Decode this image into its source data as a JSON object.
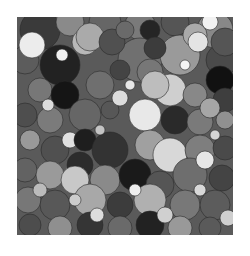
{
  "canvas": {
    "width": 250,
    "height": 256,
    "background": "#ffffff",
    "plot": {
      "x": 17,
      "y": 17,
      "width": 216,
      "height": 218,
      "fill": "#5a5a5a"
    }
  },
  "stroke": {
    "color": "#2a2a2a",
    "width": 0.6
  },
  "circles": [
    {
      "cx": 40,
      "cy": 30,
      "r": 20,
      "fill": "#3a3a3a"
    },
    {
      "cx": 70,
      "cy": 22,
      "r": 14,
      "fill": "#8a8a8a"
    },
    {
      "cx": 105,
      "cy": 22,
      "r": 16,
      "fill": "#666666"
    },
    {
      "cx": 140,
      "cy": 25,
      "r": 15,
      "fill": "#7a7a7a"
    },
    {
      "cx": 175,
      "cy": 22,
      "r": 14,
      "fill": "#555555"
    },
    {
      "cx": 215,
      "cy": 30,
      "r": 18,
      "fill": "#888888"
    },
    {
      "cx": 25,
      "cy": 60,
      "r": 14,
      "fill": "#5c5c5c"
    },
    {
      "cx": 60,
      "cy": 65,
      "r": 20,
      "fill": "#222222"
    },
    {
      "cx": 140,
      "cy": 60,
      "r": 22,
      "fill": "#707070"
    },
    {
      "cx": 180,
      "cy": 55,
      "r": 20,
      "fill": "#9a9a9a"
    },
    {
      "cx": 222,
      "cy": 60,
      "r": 16,
      "fill": "#4a4a4a"
    },
    {
      "cx": 85,
      "cy": 42,
      "r": 13,
      "fill": "#b8b8b8"
    },
    {
      "cx": 32,
      "cy": 45,
      "r": 13,
      "fill": "#ececec"
    },
    {
      "cx": 90,
      "cy": 37,
      "r": 14,
      "fill": "#aaaaaa"
    },
    {
      "cx": 112,
      "cy": 42,
      "r": 13,
      "fill": "#505050"
    },
    {
      "cx": 125,
      "cy": 30,
      "r": 9,
      "fill": "#6a6a6a"
    },
    {
      "cx": 150,
      "cy": 30,
      "r": 10,
      "fill": "#252525"
    },
    {
      "cx": 155,
      "cy": 48,
      "r": 11,
      "fill": "#3c3c3c"
    },
    {
      "cx": 150,
      "cy": 72,
      "r": 13,
      "fill": "#777777"
    },
    {
      "cx": 195,
      "cy": 35,
      "r": 12,
      "fill": "#aaaaaa"
    },
    {
      "cx": 210,
      "cy": 22,
      "r": 8,
      "fill": "#f2f2f2"
    },
    {
      "cx": 198,
      "cy": 42,
      "r": 10,
      "fill": "#e4e4e4"
    },
    {
      "cx": 225,
      "cy": 42,
      "r": 14,
      "fill": "#555555"
    },
    {
      "cx": 220,
      "cy": 80,
      "r": 14,
      "fill": "#111111"
    },
    {
      "cx": 40,
      "cy": 90,
      "r": 12,
      "fill": "#777777"
    },
    {
      "cx": 65,
      "cy": 95,
      "r": 14,
      "fill": "#151515"
    },
    {
      "cx": 100,
      "cy": 85,
      "r": 14,
      "fill": "#6f6f6f"
    },
    {
      "cx": 120,
      "cy": 70,
      "r": 10,
      "fill": "#444444"
    },
    {
      "cx": 170,
      "cy": 90,
      "r": 16,
      "fill": "#cfcfcf"
    },
    {
      "cx": 155,
      "cy": 85,
      "r": 14,
      "fill": "#bdbdbd"
    },
    {
      "cx": 195,
      "cy": 95,
      "r": 12,
      "fill": "#888888"
    },
    {
      "cx": 225,
      "cy": 100,
      "r": 12,
      "fill": "#3e3e3e"
    },
    {
      "cx": 25,
      "cy": 115,
      "r": 12,
      "fill": "#4e4e4e"
    },
    {
      "cx": 50,
      "cy": 120,
      "r": 13,
      "fill": "#7b7b7b"
    },
    {
      "cx": 85,
      "cy": 115,
      "r": 16,
      "fill": "#666666"
    },
    {
      "cx": 110,
      "cy": 110,
      "r": 9,
      "fill": "#575757"
    },
    {
      "cx": 120,
      "cy": 98,
      "r": 8,
      "fill": "#dcdcdc"
    },
    {
      "cx": 145,
      "cy": 115,
      "r": 16,
      "fill": "#e8e8e8"
    },
    {
      "cx": 175,
      "cy": 120,
      "r": 14,
      "fill": "#2a2a2a"
    },
    {
      "cx": 200,
      "cy": 122,
      "r": 13,
      "fill": "#7a7a7a"
    },
    {
      "cx": 225,
      "cy": 120,
      "r": 9,
      "fill": "#909090"
    },
    {
      "cx": 210,
      "cy": 108,
      "r": 10,
      "fill": "#a6a6a6"
    },
    {
      "cx": 30,
      "cy": 140,
      "r": 10,
      "fill": "#999999"
    },
    {
      "cx": 55,
      "cy": 150,
      "r": 14,
      "fill": "#505050"
    },
    {
      "cx": 70,
      "cy": 140,
      "r": 8,
      "fill": "#e0e0e0"
    },
    {
      "cx": 85,
      "cy": 140,
      "r": 11,
      "fill": "#1e1e1e"
    },
    {
      "cx": 110,
      "cy": 150,
      "r": 18,
      "fill": "#333333"
    },
    {
      "cx": 150,
      "cy": 145,
      "r": 15,
      "fill": "#a0a0a0"
    },
    {
      "cx": 170,
      "cy": 155,
      "r": 17,
      "fill": "#d8d8d8"
    },
    {
      "cx": 200,
      "cy": 150,
      "r": 15,
      "fill": "#7e7e7e"
    },
    {
      "cx": 225,
      "cy": 148,
      "r": 12,
      "fill": "#4a4a4a"
    },
    {
      "cx": 25,
      "cy": 170,
      "r": 12,
      "fill": "#626262"
    },
    {
      "cx": 50,
      "cy": 175,
      "r": 14,
      "fill": "#9a9a9a"
    },
    {
      "cx": 80,
      "cy": 165,
      "r": 13,
      "fill": "#2c2c2c"
    },
    {
      "cx": 75,
      "cy": 180,
      "r": 14,
      "fill": "#c8c8c8"
    },
    {
      "cx": 105,
      "cy": 180,
      "r": 15,
      "fill": "#8a8a8a"
    },
    {
      "cx": 135,
      "cy": 175,
      "r": 16,
      "fill": "#1a1a1a"
    },
    {
      "cx": 160,
      "cy": 185,
      "r": 14,
      "fill": "#555555"
    },
    {
      "cx": 190,
      "cy": 175,
      "r": 17,
      "fill": "#6e6e6e"
    },
    {
      "cx": 222,
      "cy": 178,
      "r": 13,
      "fill": "#444444"
    },
    {
      "cx": 205,
      "cy": 160,
      "r": 9,
      "fill": "#e6e6e6"
    },
    {
      "cx": 28,
      "cy": 200,
      "r": 13,
      "fill": "#777777"
    },
    {
      "cx": 55,
      "cy": 205,
      "r": 15,
      "fill": "#585858"
    },
    {
      "cx": 90,
      "cy": 200,
      "r": 16,
      "fill": "#a8a8a8"
    },
    {
      "cx": 120,
      "cy": 205,
      "r": 13,
      "fill": "#3c3c3c"
    },
    {
      "cx": 150,
      "cy": 200,
      "r": 16,
      "fill": "#b0b0b0"
    },
    {
      "cx": 185,
      "cy": 205,
      "r": 15,
      "fill": "#787878"
    },
    {
      "cx": 215,
      "cy": 205,
      "r": 15,
      "fill": "#5c5c5c"
    },
    {
      "cx": 30,
      "cy": 225,
      "r": 11,
      "fill": "#4d4d4d"
    },
    {
      "cx": 60,
      "cy": 228,
      "r": 12,
      "fill": "#8f8f8f"
    },
    {
      "cx": 90,
      "cy": 225,
      "r": 13,
      "fill": "#353535"
    },
    {
      "cx": 120,
      "cy": 228,
      "r": 12,
      "fill": "#6a6a6a"
    },
    {
      "cx": 150,
      "cy": 225,
      "r": 14,
      "fill": "#222222"
    },
    {
      "cx": 180,
      "cy": 228,
      "r": 12,
      "fill": "#999999"
    },
    {
      "cx": 210,
      "cy": 228,
      "r": 11,
      "fill": "#5a5a5a"
    },
    {
      "cx": 228,
      "cy": 218,
      "r": 8,
      "fill": "#cfcfcf"
    },
    {
      "cx": 40,
      "cy": 190,
      "r": 7,
      "fill": "#bbbbbb"
    },
    {
      "cx": 97,
      "cy": 215,
      "r": 7,
      "fill": "#dddddd"
    },
    {
      "cx": 165,
      "cy": 215,
      "r": 8,
      "fill": "#d0d0d0"
    },
    {
      "cx": 135,
      "cy": 190,
      "r": 6,
      "fill": "#eeeeee"
    },
    {
      "cx": 62,
      "cy": 55,
      "r": 6,
      "fill": "#f0f0f0"
    },
    {
      "cx": 130,
      "cy": 85,
      "r": 5,
      "fill": "#e8e8e8"
    },
    {
      "cx": 185,
      "cy": 65,
      "r": 5,
      "fill": "#f4f4f4"
    },
    {
      "cx": 48,
      "cy": 105,
      "r": 6,
      "fill": "#dcdcdc"
    },
    {
      "cx": 215,
      "cy": 135,
      "r": 5,
      "fill": "#d6d6d6"
    },
    {
      "cx": 100,
      "cy": 130,
      "r": 5,
      "fill": "#c4c4c4"
    },
    {
      "cx": 75,
      "cy": 200,
      "r": 6,
      "fill": "#cccccc"
    },
    {
      "cx": 200,
      "cy": 190,
      "r": 6,
      "fill": "#d8d8d8"
    }
  ]
}
